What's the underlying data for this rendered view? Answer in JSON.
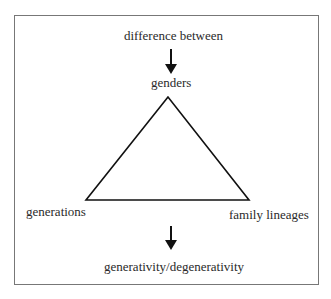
{
  "diagram": {
    "top_label": "difference between",
    "apex_label": "genders",
    "left_label": "generations",
    "right_label": "family lineages",
    "bottom_label": "generativity/degenerativity",
    "shape": "triangle",
    "arrows": [
      "down-arrow-top",
      "down-arrow-bottom"
    ]
  }
}
